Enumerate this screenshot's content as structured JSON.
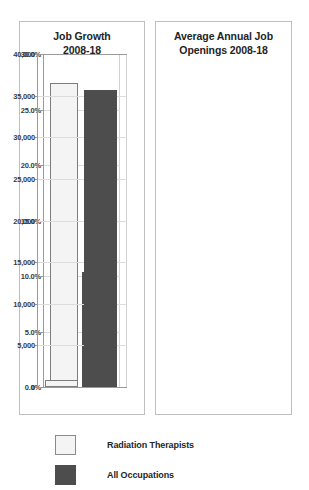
{
  "legend": {
    "items": [
      {
        "label": "Radiation Therapists",
        "swatch": "light",
        "color": "#f4f4f4"
      },
      {
        "label": "All Occupations",
        "swatch": "dark",
        "color": "#4d4d4d"
      }
    ]
  },
  "charts": {
    "left": {
      "title_line1": "Job Growth",
      "title_line2": "2008-18"
    },
    "right": {
      "title_line1": "Average Annual Job",
      "title_line2": "Openings 2008-18"
    }
  },
  "chart_data": [
    {
      "type": "bar",
      "title": "Job Growth 2008-18",
      "categories": [
        "Radiation Therapists",
        "All Occupations"
      ],
      "values": [
        27.4,
        10.4
      ],
      "value_unit": "percent",
      "tick_labels": [
        "0.0%",
        "5.0%",
        "10.0%",
        "15.0%",
        "20.0%",
        "25.0%",
        "30.0%"
      ],
      "tick_values": [
        0,
        5,
        10,
        15,
        20,
        25,
        30
      ],
      "ylim": [
        0,
        30
      ],
      "xlabel": "",
      "ylabel": "",
      "grid": true,
      "legend_position": "below-figure",
      "series_colors": [
        "#f4f4f4",
        "#4d4d4d"
      ]
    },
    {
      "type": "bar",
      "title": "Average Annual Job Openings 2008-18",
      "categories": [
        "Radiation Therapists",
        "All Occupations"
      ],
      "values": [
        900,
        35700
      ],
      "value_unit": "openings",
      "tick_labels": [
        "0",
        "5,000",
        "10,000",
        "15,000",
        "20,000",
        "25,000",
        "30,000",
        "35,000",
        "40,000"
      ],
      "tick_values": [
        0,
        5000,
        10000,
        15000,
        20000,
        25000,
        30000,
        35000,
        40000
      ],
      "ylim": [
        0,
        40000
      ],
      "xlabel": "",
      "ylabel": "",
      "grid": true,
      "legend_position": "below-figure",
      "series_colors": [
        "#f4f4f4",
        "#4d4d4d"
      ]
    }
  ]
}
